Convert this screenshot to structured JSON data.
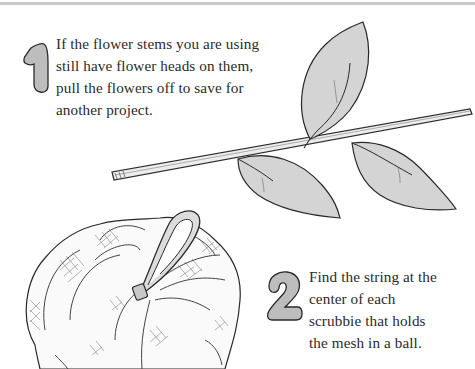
{
  "steps": [
    {
      "number": "1",
      "lines": [
        "If the flower stems you are using",
        "still have flower heads on them,",
        "pull the flowers off to save for",
        "another project."
      ]
    },
    {
      "number": "2",
      "lines": [
        "Find the string at the",
        "center of each",
        "scrubbie that holds",
        "the mesh in a ball."
      ]
    }
  ],
  "illustrations": {
    "stem": "flower-stem-with-leaves",
    "scrubbie": "mesh-scrubbie-with-string-loop"
  },
  "colors": {
    "number_fill": "#bdbdbd",
    "leaf_fill": "#d4d4d4",
    "outline": "#2a2a2a"
  }
}
